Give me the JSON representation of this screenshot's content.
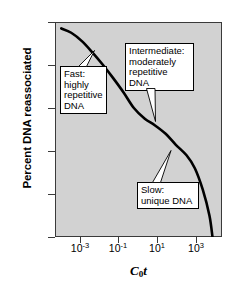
{
  "figure": {
    "background_color": "#ffffff",
    "plot_background_color": "#d2d2d2",
    "curve_color": "#000000"
  },
  "chart_data": {
    "type": "line",
    "title": "",
    "xlabel": "C0t",
    "xlabel_display": "C",
    "xlabel_sub": "0",
    "xlabel_italic_t": "t",
    "ylabel": "Percent DNA reassociated",
    "x_scale": "log",
    "xlim": [
      0.0001,
      10000
    ],
    "ylim": [
      0,
      100
    ],
    "y_axis_inverted": true,
    "grid": false,
    "legend": false,
    "xticks": [
      {
        "value": 0.001,
        "label": "10-3",
        "mantissa": "10",
        "exponent": "-3"
      },
      {
        "value": 0.1,
        "label": "10-1",
        "mantissa": "10",
        "exponent": "-1"
      },
      {
        "value": 10,
        "label": "101",
        "mantissa": "10",
        "exponent": "1"
      },
      {
        "value": 1000,
        "label": "103",
        "mantissa": "10",
        "exponent": "3"
      }
    ],
    "yticks": [
      {
        "value": 0,
        "label": "0"
      },
      {
        "value": 20,
        "label": "20"
      },
      {
        "value": 40,
        "label": "40"
      },
      {
        "value": 60,
        "label": "60"
      },
      {
        "value": 80,
        "label": "80"
      },
      {
        "value": 100,
        "label": "100"
      }
    ],
    "series": [
      {
        "name": "Cot reassociation curve",
        "description": "Three-component DNA reassociation kinetics curve",
        "points": [
          {
            "x": 0.0002,
            "y": 3
          },
          {
            "x": 0.0006,
            "y": 5
          },
          {
            "x": 0.002,
            "y": 9
          },
          {
            "x": 0.006,
            "y": 14
          },
          {
            "x": 0.02,
            "y": 20
          },
          {
            "x": 0.06,
            "y": 26
          },
          {
            "x": 0.2,
            "y": 33
          },
          {
            "x": 0.6,
            "y": 40
          },
          {
            "x": 2,
            "y": 45
          },
          {
            "x": 6,
            "y": 48
          },
          {
            "x": 20,
            "y": 52
          },
          {
            "x": 60,
            "y": 57
          },
          {
            "x": 200,
            "y": 62
          },
          {
            "x": 500,
            "y": 68
          },
          {
            "x": 1200,
            "y": 78
          },
          {
            "x": 2500,
            "y": 90
          },
          {
            "x": 3500,
            "y": 100
          }
        ]
      }
    ],
    "annotations": [
      {
        "id": "fast",
        "text": "Fast:\nhighly\nrepetitive\nDNA",
        "component": "highly repetitive DNA",
        "speed": "Fast",
        "points_to": {
          "x": 0.01,
          "y": 17
        }
      },
      {
        "id": "intermediate",
        "text": "Intermediate:\nmoderately\nrepetitive DNA",
        "component": "moderately repetitive DNA",
        "speed": "Intermediate",
        "points_to": {
          "x": 8,
          "y": 48
        }
      },
      {
        "id": "slow",
        "text": "Slow:\nunique DNA",
        "component": "unique DNA",
        "speed": "Slow",
        "points_to": {
          "x": 150,
          "y": 61
        }
      }
    ]
  }
}
